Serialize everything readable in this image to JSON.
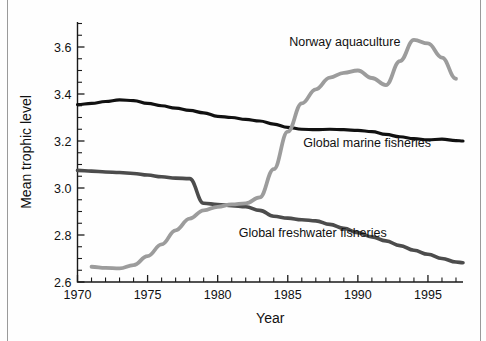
{
  "chart_data": {
    "type": "line",
    "title": "",
    "xlabel": "Year",
    "ylabel": "Mean trophic level",
    "xlim": [
      1970,
      1997.5
    ],
    "ylim": [
      2.6,
      3.7
    ],
    "yticks": [
      2.6,
      2.8,
      3.0,
      3.2,
      3.4,
      3.6
    ],
    "ytick_labels": [
      "2.6",
      "2.8",
      "3.0",
      "3.2",
      "3.4",
      "3.6"
    ],
    "ytick_minor_step": 0.05,
    "xticks": [
      1970,
      1975,
      1980,
      1985,
      1990,
      1995
    ],
    "xtick_labels": [
      "1970",
      "1975",
      "1980",
      "1985",
      "1990",
      "1995"
    ],
    "xtick_minor_step": 1,
    "grid": false,
    "legend_position": "inline-annotations",
    "series": [
      {
        "name": "Global marine fisheries",
        "color": "#111111",
        "linewidth": 3.2,
        "label_x": 1986.1,
        "label_y": 3.175,
        "x": [
          1970,
          1971,
          1972,
          1973,
          1974,
          1975,
          1976,
          1977,
          1978,
          1979,
          1980,
          1981,
          1982,
          1983,
          1984,
          1985,
          1986,
          1987,
          1988,
          1989,
          1990,
          1991,
          1992,
          1993,
          1994,
          1995,
          1996,
          1997,
          1997.5
        ],
        "values": [
          3.355,
          3.36,
          3.368,
          3.375,
          3.372,
          3.36,
          3.35,
          3.34,
          3.33,
          3.32,
          3.305,
          3.3,
          3.292,
          3.285,
          3.272,
          3.258,
          3.25,
          3.248,
          3.25,
          3.248,
          3.245,
          3.24,
          3.228,
          3.218,
          3.21,
          3.205,
          3.208,
          3.202,
          3.2
        ]
      },
      {
        "name": "Global freshwater fisheries",
        "color": "#4c4c4c",
        "linewidth": 3.6,
        "label_x": 1981.5,
        "label_y": 2.79,
        "x": [
          1970,
          1971,
          1972,
          1973,
          1974,
          1975,
          1976,
          1977,
          1978,
          1979,
          1980,
          1981,
          1982,
          1983,
          1984,
          1985,
          1986,
          1987,
          1988,
          1989,
          1990,
          1991,
          1992,
          1993,
          1994,
          1995,
          1996,
          1997,
          1997.5
        ],
        "values": [
          3.075,
          3.072,
          3.068,
          3.066,
          3.062,
          3.055,
          3.048,
          3.042,
          3.04,
          2.935,
          2.93,
          2.925,
          2.92,
          2.905,
          2.88,
          2.872,
          2.865,
          2.86,
          2.845,
          2.828,
          2.81,
          2.792,
          2.775,
          2.755,
          2.735,
          2.718,
          2.7,
          2.685,
          2.682
        ]
      },
      {
        "name": "Norway aquaculture",
        "color": "#9c9c9c",
        "linewidth": 3.8,
        "label_x": 1985.1,
        "label_y": 3.605,
        "x": [
          1971,
          1972,
          1973,
          1974,
          1975,
          1976,
          1977,
          1978,
          1979,
          1980,
          1981,
          1982,
          1983,
          1984,
          1985,
          1986,
          1987,
          1988,
          1989,
          1990,
          1991,
          1992,
          1993,
          1994,
          1995,
          1996,
          1997
        ],
        "values": [
          2.665,
          2.66,
          2.658,
          2.672,
          2.71,
          2.76,
          2.82,
          2.87,
          2.905,
          2.92,
          2.93,
          2.935,
          2.96,
          3.08,
          3.24,
          3.36,
          3.42,
          3.47,
          3.49,
          3.5,
          3.468,
          3.438,
          3.54,
          3.63,
          3.615,
          3.555,
          3.465
        ]
      }
    ]
  },
  "axis_titles": {
    "x": "Year",
    "y": "Mean trophic level"
  }
}
